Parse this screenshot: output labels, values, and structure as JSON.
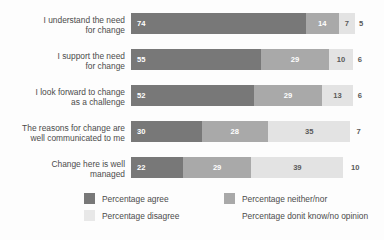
{
  "chart_data": {
    "type": "bar",
    "subtype": "stacked-horizontal-100pct",
    "title": "",
    "xlabel": "",
    "ylabel": "",
    "xlim": [
      0,
      100
    ],
    "grid": false,
    "legend_position": "bottom",
    "categories": [
      "I understand the need\nfor change",
      "I support the need\nfor change",
      "I look forward to change\nas a challenge",
      "The reasons for change are\nwell communicated to me",
      "Change here is well\nmanaged"
    ],
    "series": [
      {
        "name": "Percentage agree",
        "color": "#787878",
        "values": [
          74,
          55,
          52,
          30,
          22
        ]
      },
      {
        "name": "Percentage neither/nor",
        "color": "#a9a9a9",
        "values": [
          14,
          29,
          29,
          28,
          29
        ]
      },
      {
        "name": "Percentage disagree",
        "color": "#e3e3e3",
        "values": [
          7,
          10,
          13,
          35,
          39
        ]
      },
      {
        "name": "Percentage donit know/no opinion",
        "color": "#fdfdfd",
        "values": [
          5,
          6,
          6,
          7,
          10
        ]
      }
    ]
  },
  "legend": {
    "items": [
      {
        "label": "Percentage agree",
        "swatch": "k0"
      },
      {
        "label": "Percentage neither/nor",
        "swatch": "k1"
      },
      {
        "label": "Percentage disagree",
        "swatch": "k2"
      },
      {
        "label": "Percentage donit know/no opinion",
        "swatch": "k3"
      }
    ]
  }
}
